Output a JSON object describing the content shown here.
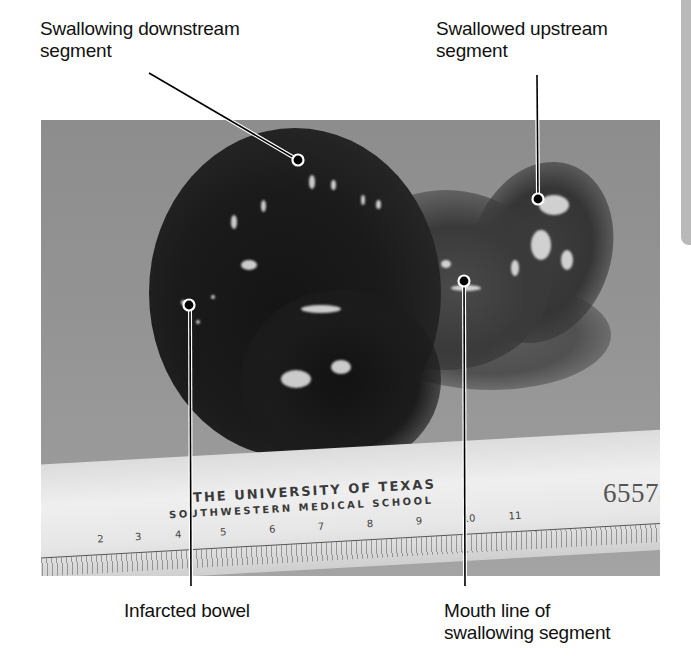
{
  "labels": {
    "top_left": "Swallowing downstream\nsegment",
    "top_right": "Swallowed upstream\nsegment",
    "bottom_left": "Infarcted bowel",
    "bottom_right": "Mouth line of\nswallowing segment"
  },
  "photo": {
    "ruler_line1": "THE UNIVERSITY OF TEXAS",
    "ruler_line2": "SOUTHWESTERN MEDICAL SCHOOL",
    "ruler_numbers": [
      "2",
      "3",
      "4",
      "5",
      "6",
      "7",
      "8",
      "9",
      "10",
      "11"
    ],
    "specimen_number": "65578"
  },
  "colors": {
    "background": "#ffffff",
    "photo_background": "#939393",
    "leader_line": "#000000",
    "leader_outline": "#ffffff",
    "side_tab": "#b9b9b9"
  }
}
